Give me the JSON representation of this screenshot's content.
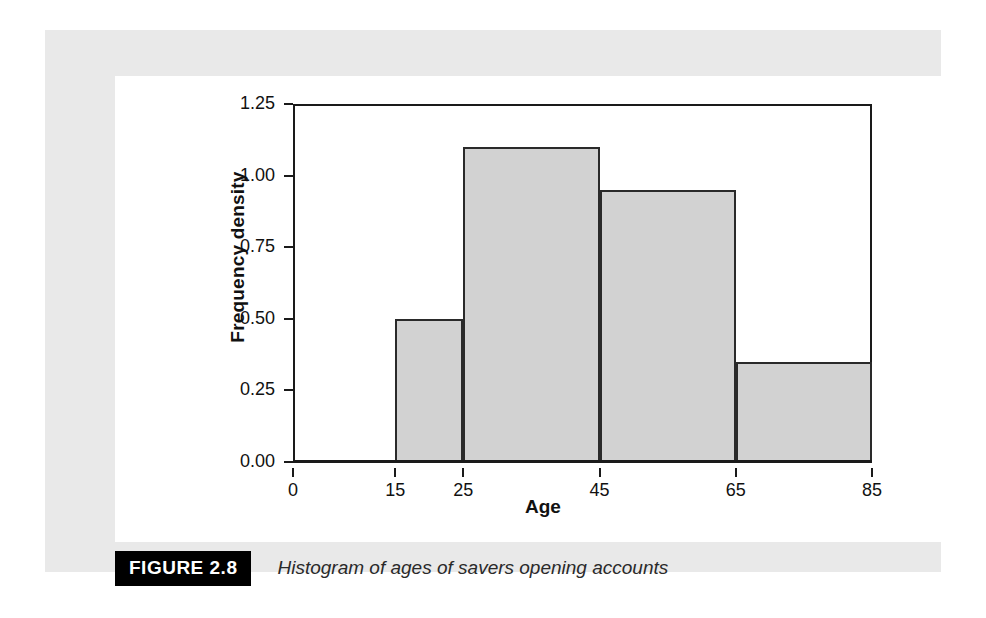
{
  "figure": {
    "tag": "FIGURE 2.8",
    "caption": "Histogram of ages of savers opening accounts"
  },
  "colors": {
    "panel_background": "#e9e9e9",
    "card_background": "#ffffff",
    "bar_fill": "#d2d2d2",
    "bar_outline": "#2a2a2a",
    "axis": "#1a1a1a",
    "tag_background": "#000000",
    "tag_text": "#ffffff"
  },
  "chart_data": {
    "type": "bar",
    "title": "",
    "subtitle": "",
    "xlabel": "Age",
    "ylabel": "Frequency density",
    "xlim": [
      0,
      85
    ],
    "ylim": [
      0,
      1.25
    ],
    "grid": false,
    "legend": false,
    "xtick_labels": [
      "0",
      "15",
      "25",
      "45",
      "65",
      "85"
    ],
    "xticks": [
      0,
      15,
      25,
      45,
      65,
      85
    ],
    "ytick_labels": [
      "0.00",
      "0.25",
      "0.50",
      "0.75",
      "1.00",
      "1.25"
    ],
    "yticks": [
      0,
      0.25,
      0.5,
      0.75,
      1.0,
      1.25
    ],
    "bins": [
      {
        "label": "15-25",
        "start": 15,
        "end": 25,
        "value": 0.5
      },
      {
        "label": "25-45",
        "start": 25,
        "end": 45,
        "value": 1.1
      },
      {
        "label": "45-65",
        "start": 45,
        "end": 65,
        "value": 0.95
      },
      {
        "label": "65-85",
        "start": 65,
        "end": 85,
        "value": 0.35
      }
    ],
    "categories": [
      "15-25",
      "25-45",
      "45-65",
      "65-85"
    ],
    "values": [
      0.5,
      1.1,
      0.95,
      0.35
    ]
  }
}
